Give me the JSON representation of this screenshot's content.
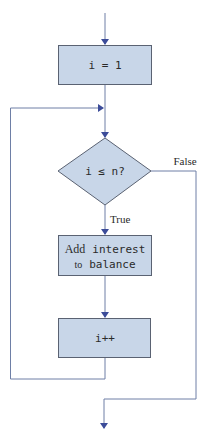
{
  "diagram": {
    "type": "flowchart",
    "colors": {
      "node_fill": "#c8d6e8",
      "node_stroke": "#5a6272",
      "edge": "#6e7fa6",
      "arrow": "#3c4c99",
      "text": "#2a2a2a"
    },
    "nodes": {
      "init": {
        "label": "i = 1"
      },
      "condition": {
        "label": "i ≤ n?"
      },
      "body": {
        "word1": "Add",
        "word2": "interest",
        "word3": "to",
        "word4": "balance"
      },
      "increment": {
        "label": "i++"
      }
    },
    "edges": {
      "true_label": "True",
      "false_label": "False"
    }
  }
}
